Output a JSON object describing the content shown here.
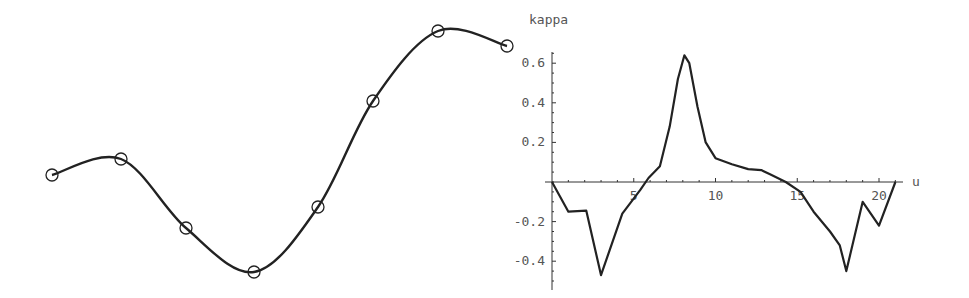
{
  "chart_data": [
    {
      "type": "line",
      "title": "",
      "description": "Interpolating spline curve through data points (circles)",
      "xlabel": "",
      "ylabel": "",
      "axes_visible": false,
      "points_px": [
        [
          52,
          175
        ],
        [
          121,
          159
        ],
        [
          186,
          228
        ],
        [
          254,
          272
        ],
        [
          318,
          207
        ],
        [
          373,
          101
        ],
        [
          438,
          31
        ],
        [
          507,
          46
        ]
      ],
      "curve_color": "#222222",
      "marker": "open-circle"
    },
    {
      "type": "line",
      "title": "",
      "xlabel": "u",
      "ylabel": "kappa",
      "xlim": [
        0,
        21.5
      ],
      "ylim": [
        -0.5,
        0.68
      ],
      "x_ticks": [
        5,
        10,
        15,
        20
      ],
      "y_ticks": [
        -0.4,
        -0.2,
        0.2,
        0.4,
        0.6
      ],
      "y_tick_labels": [
        "-0.4",
        "-0.2",
        "0.2",
        "0.4",
        "0.6"
      ],
      "grid": false,
      "series": [
        {
          "name": "kappa(u)",
          "x": [
            0,
            1,
            2.1,
            3,
            4.3,
            5.4,
            5.9,
            6.6,
            7.2,
            7.7,
            8.1,
            8.4,
            8.9,
            9.4,
            10,
            11,
            12,
            12.8,
            13.3,
            14.3,
            15.2,
            16,
            17,
            17.6,
            18,
            19,
            20,
            21
          ],
          "y": [
            0,
            -0.15,
            -0.145,
            -0.47,
            -0.16,
            -0.04,
            0.02,
            0.08,
            0.28,
            0.52,
            0.64,
            0.6,
            0.38,
            0.2,
            0.12,
            0.09,
            0.065,
            0.06,
            0.04,
            0.0,
            -0.05,
            -0.15,
            -0.25,
            -0.32,
            -0.45,
            -0.1,
            -0.22,
            0.0
          ]
        }
      ]
    }
  ],
  "labels": {
    "y_axis": "kappa",
    "x_axis": "u",
    "x_ticks": [
      "5",
      "10",
      "15",
      "20"
    ],
    "y_ticks": [
      "0.6",
      "0.4",
      "0.2",
      "-0.2",
      "-0.4"
    ]
  }
}
